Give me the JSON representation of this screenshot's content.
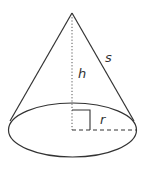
{
  "diagram": {
    "labels": {
      "height": "h",
      "slant": "s",
      "radius": "r"
    },
    "colors": {
      "stroke": "#333333",
      "background": "#ffffff"
    }
  }
}
